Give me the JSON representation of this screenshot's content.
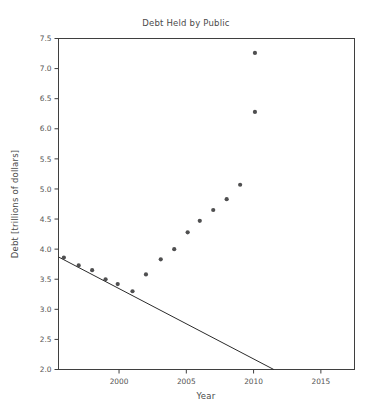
{
  "chart_data": {
    "type": "scatter",
    "title": "Debt Held by Public",
    "xlabel": "Year",
    "ylabel": "Debt [trillions of dollars]",
    "xlim": [
      1995.5,
      2017.5
    ],
    "ylim": [
      2.0,
      7.5
    ],
    "xticks": [
      2000,
      2005,
      2010,
      2015
    ],
    "xtick_labels": [
      "2000",
      "2005",
      "2010",
      "2015"
    ],
    "yticks": [
      2.0,
      2.5,
      3.0,
      3.5,
      4.0,
      4.5,
      5.0,
      5.5,
      6.0,
      6.5,
      7.0,
      7.5
    ],
    "ytick_labels": [
      "2.0",
      "2.5",
      "3.0",
      "3.5",
      "4.0",
      "4.5",
      "5.0",
      "5.5",
      "6.0",
      "6.5",
      "7.0",
      "7.5"
    ],
    "grid": false,
    "legend": null,
    "marker_color": "#4f4f50",
    "line_color": "#2b2b2b",
    "series": [
      {
        "name": "Debt Held by Public",
        "kind": "scatter",
        "x": [
          1995.9,
          1997.0,
          1998.0,
          1999.0,
          1999.9,
          2001.0,
          2002.0,
          2003.1,
          2004.1,
          2005.1,
          2006.0,
          2007.0,
          2008.0,
          2009.0,
          2010.1
        ],
        "y": [
          3.86,
          3.73,
          3.65,
          3.5,
          3.42,
          3.3,
          3.58,
          3.83,
          4.0,
          4.28,
          4.47,
          4.65,
          4.83,
          5.07,
          6.28
        ]
      },
      {
        "name": "Trend line",
        "kind": "line",
        "x": [
          1995.5,
          2011.5
        ],
        "y": [
          3.87,
          2.0
        ]
      }
    ],
    "extra_points": {
      "x": [
        2010.1
      ],
      "y": [
        7.26
      ]
    }
  },
  "figure": {
    "title": "Debt Held by Public",
    "xlabel": "Year",
    "ylabel": "Debt [trillions of dollars]"
  }
}
